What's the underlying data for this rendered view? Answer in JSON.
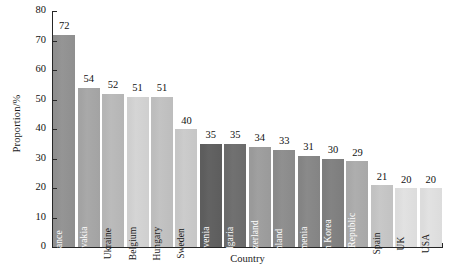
{
  "chart_data": {
    "type": "bar",
    "title": "",
    "xlabel": "Country",
    "ylabel": "Proportion/%",
    "ylim": [
      0,
      80
    ],
    "yticks": [
      0,
      10,
      20,
      30,
      40,
      50,
      60,
      70,
      80
    ],
    "grid": false,
    "legend": false,
    "categories": [
      "France",
      "Slovakia",
      "Ukraine",
      "Belgium",
      "Hungary",
      "Sweden",
      "Slovenia",
      "Bulgaria",
      "Switzerland",
      "Finland",
      "Armenia",
      "South Korea",
      "Czech Republic",
      "Spain",
      "UK",
      "USA"
    ],
    "values": [
      72,
      54,
      52,
      51,
      51,
      40,
      35,
      35,
      34,
      33,
      31,
      30,
      29,
      21,
      20,
      20
    ],
    "bar_colors": [
      "#8f8f8f",
      "#a3a3a3",
      "#b5b5b5",
      "#cfcfcf",
      "#bdbdbd",
      "#c6c6c6",
      "#5d5d5d",
      "#6b6b6b",
      "#9a9a9a",
      "#8a8a8a",
      "#848484",
      "#7d7d7d",
      "#a8a8a8",
      "#c2c2c2",
      "#dcdcdc",
      "#dcdcdc"
    ],
    "label_colors": [
      "#ffffff",
      "#ffffff",
      "#1a1a1a",
      "#1a1a1a",
      "#1a1a1a",
      "#1a1a1a",
      "#ffffff",
      "#ffffff",
      "#ffffff",
      "#ffffff",
      "#ffffff",
      "#ffffff",
      "#ffffff",
      "#1a1a1a",
      "#1a1a1a",
      "#1a1a1a"
    ],
    "axis_color": "#262626",
    "value_label_color": "#111111",
    "background": "#ffffff"
  }
}
